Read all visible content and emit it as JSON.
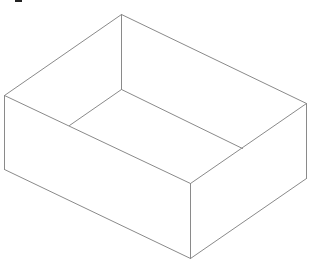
{
  "diagram": {
    "type": "isometric-open-box",
    "stroke_color": "#8a8a8a",
    "background": "#ffffff",
    "vertices": {
      "top_back": [
        121,
        14
      ],
      "left_top": [
        4,
        95
      ],
      "right_top": [
        306,
        103
      ],
      "front_top": [
        190,
        183
      ],
      "left_bottom": [
        4,
        169
      ],
      "right_bottom": [
        306,
        178
      ],
      "front_bottom": [
        190,
        258
      ],
      "inner_back_bottom": [
        121,
        89
      ],
      "inner_left": [
        69,
        125
      ],
      "inner_right": [
        242,
        148
      ]
    },
    "edges": [
      [
        "top_back",
        "left_top"
      ],
      [
        "top_back",
        "right_top"
      ],
      [
        "left_top",
        "front_top"
      ],
      [
        "right_top",
        "front_top"
      ],
      [
        "left_top",
        "left_bottom"
      ],
      [
        "right_top",
        "right_bottom"
      ],
      [
        "front_top",
        "front_bottom"
      ],
      [
        "left_bottom",
        "front_bottom"
      ],
      [
        "right_bottom",
        "front_bottom"
      ],
      [
        "top_back",
        "inner_back_bottom"
      ],
      [
        "inner_back_bottom",
        "inner_left"
      ],
      [
        "inner_back_bottom",
        "inner_right"
      ]
    ]
  }
}
